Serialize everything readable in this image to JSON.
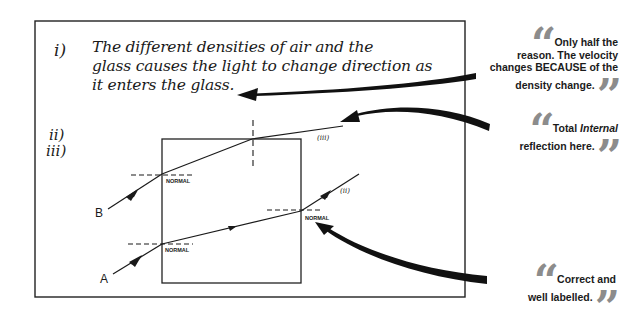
{
  "question_labels": {
    "part_i": "i)",
    "part_ii": "ii)",
    "part_iii": "iii)"
  },
  "answer_text": {
    "line1": "The different densities of air and the",
    "line2": "glass causes the light to change direction as",
    "line3": "it enters the glass."
  },
  "diagram": {
    "ray_b_label": "B",
    "ray_a_label": "A",
    "normal_label_b": "NORMAL",
    "normal_label_a_entry": "NORMAL",
    "normal_label_a_exit": "NORMAL",
    "ray_ii_label": "(ii)",
    "ray_iii_label": "(iii)"
  },
  "comments": [
    {
      "id": "comment-velocity",
      "lines": [
        "Only half the",
        "reason. The velocity",
        "changes BECAUSE of the",
        "density change."
      ]
    },
    {
      "id": "comment-tir",
      "line1_prefix": "Total ",
      "line1_emphasis": "Internal",
      "line2": "reflection here."
    },
    {
      "id": "comment-correct",
      "line1": "Correct and",
      "line2": "well labelled."
    }
  ],
  "colors": {
    "ink": "#1a1a1a",
    "quote_marks": "#8c8c8c",
    "background": "#ffffff"
  },
  "icons": {
    "open_quote": "“",
    "close_quote": "”"
  }
}
